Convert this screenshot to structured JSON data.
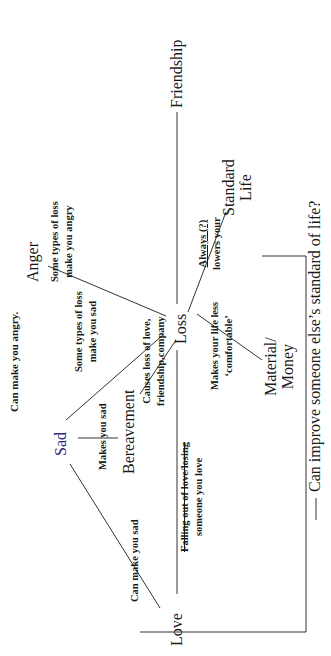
{
  "diagram": {
    "nodes": {
      "love": "Love",
      "sad": "Sad",
      "bereavement": "Bereavement",
      "anger": "Anger",
      "loss": "Loss",
      "friendship": "Friendship",
      "standard_life_1": "Standard",
      "standard_life_2": "Life",
      "material_1": "Material/",
      "material_2": "Money"
    },
    "edge_labels": {
      "love_anger": "Can make you angry.",
      "love_sad": "Can make you sad",
      "sad_bereavement": "Makes you sad",
      "sad_loss_1": "Some types of loss",
      "sad_loss_2": "make you sad",
      "anger_loss_1": "Some types of loss",
      "anger_loss_2": "make you angry",
      "love_loss_1": "Falling out of love/losing",
      "love_loss_2": "someone you love",
      "bereavement_loss_1": "Causes loss of love,",
      "bereavement_loss_2": "friendship,company",
      "loss_material_1": "Makes your life less",
      "loss_material_2": "‘comfortable’",
      "loss_standard_1": "Always (?)",
      "loss_standard_2": "lowers your"
    },
    "question": "Can improve someone else’s standard of life?",
    "orientation": "rotated -90deg (text reads bottom-to-top)"
  }
}
